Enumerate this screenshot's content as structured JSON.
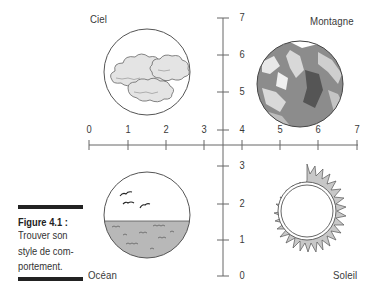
{
  "figure": {
    "caption_title": "Figure 4.1 :",
    "caption_lines": [
      "Trouver son",
      "style de com-",
      "portement."
    ]
  },
  "quadrants": {
    "top_left": {
      "label": "Ciel",
      "icon": "clouds-icon"
    },
    "top_right": {
      "label": "Montagne",
      "icon": "mountain-icon"
    },
    "bottom_left": {
      "label": "Océan",
      "icon": "ocean-birds-icon"
    },
    "bottom_right": {
      "label": "Soleil",
      "icon": "sun-icon"
    }
  },
  "axes": {
    "x_ticks": [
      "0",
      "1",
      "2",
      "3",
      "4",
      "5",
      "6",
      "7"
    ],
    "y_ticks_upper": [
      "7",
      "6",
      "5",
      "4"
    ],
    "y_ticks_lower": [
      "3",
      "2",
      "1",
      "0"
    ]
  },
  "colors": {
    "line": "#555555",
    "cloud_fill": "#e6e6e6",
    "water_fill": "#b8b8b8",
    "mountain_dark": "#6e6e6e",
    "mountain_mid": "#9a9a9a",
    "sun_rays": "#c8c8c8"
  }
}
